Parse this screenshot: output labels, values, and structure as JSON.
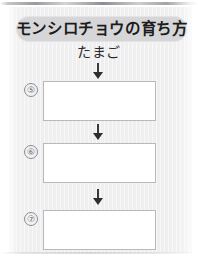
{
  "worksheet": {
    "title": "モンシロチョウの育ち方",
    "first_stage_label": "たまご",
    "arrow_icon_name": "down-arrow-icon",
    "flow": [
      {
        "marker": "⑤",
        "marker_name": "item-marker-5",
        "box_name": "answer-box-5",
        "answer": ""
      },
      {
        "marker": "⑥",
        "marker_name": "item-marker-6",
        "box_name": "answer-box-6",
        "answer": ""
      },
      {
        "marker": "⑦",
        "marker_name": "item-marker-7",
        "box_name": "answer-box-7",
        "answer": ""
      }
    ],
    "colors": {
      "page_background": "#efeff0",
      "title_badge_fill": "#d6d6d8",
      "title_text": "#1c1c1c",
      "box_fill": "#ffffff",
      "box_border": "#b9b9bc",
      "arrow": "#2e2e30",
      "marker_outline": "#8c8c90"
    }
  }
}
